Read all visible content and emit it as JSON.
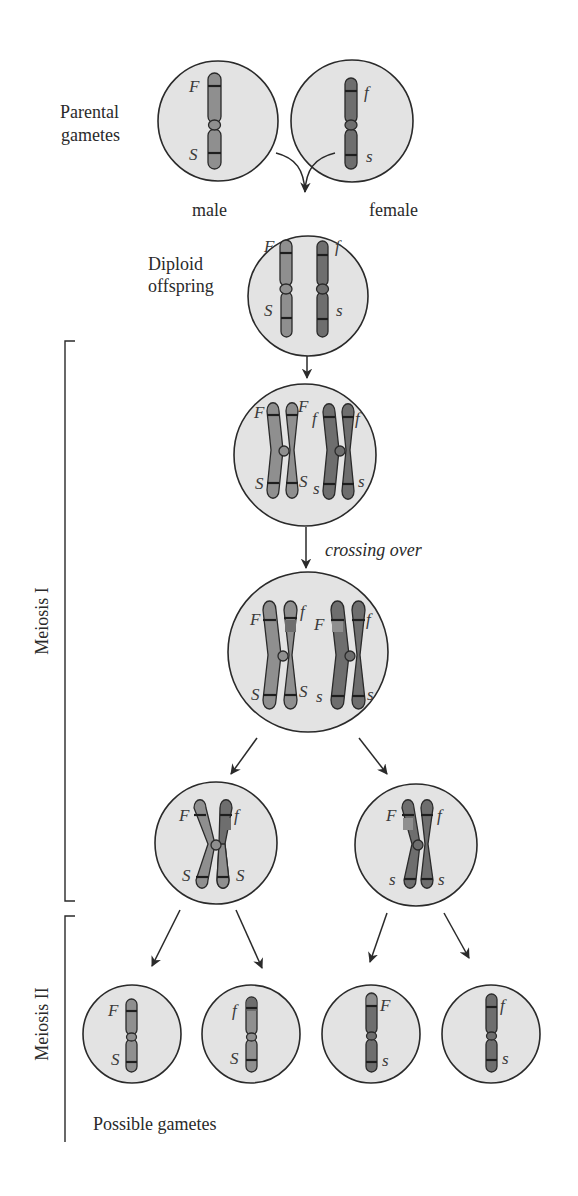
{
  "figure": {
    "stage_labels": {
      "parental_gametes_line1": "Parental",
      "parental_gametes_line2": "gametes",
      "male": "male",
      "female": "female",
      "diploid_line1": "Diploid",
      "diploid_line2": "offspring",
      "crossing_over": "crossing over",
      "possible_gametes": "Possible gametes"
    },
    "phases": {
      "meiosis_1": "Meiosis I",
      "meiosis_2": "Meiosis II"
    },
    "alleles": {
      "F": "F",
      "f": "f",
      "S": "S",
      "s": "s"
    },
    "cells": [
      {
        "id": "male-gamete",
        "alleles": [
          "F",
          "S"
        ]
      },
      {
        "id": "female-gamete",
        "alleles": [
          "f",
          "s"
        ]
      },
      {
        "id": "diploid-offspring",
        "alleles": [
          "F",
          "S",
          "f",
          "s"
        ]
      },
      {
        "id": "replicated-pairs",
        "alleles": [
          "F",
          "F",
          "S",
          "S",
          "f",
          "f",
          "s",
          "s"
        ]
      },
      {
        "id": "after-crossing-over",
        "alleles": [
          "F",
          "f",
          "S",
          "S",
          "F",
          "f",
          "s",
          "s"
        ]
      },
      {
        "id": "meiosis1-product-left",
        "alleles": [
          "F",
          "f",
          "S",
          "S"
        ]
      },
      {
        "id": "meiosis1-product-right",
        "alleles": [
          "F",
          "f",
          "s",
          "s"
        ]
      },
      {
        "id": "gamete-1",
        "alleles": [
          "F",
          "S"
        ]
      },
      {
        "id": "gamete-2",
        "alleles": [
          "f",
          "S"
        ]
      },
      {
        "id": "gamete-3",
        "alleles": [
          "F",
          "s"
        ]
      },
      {
        "id": "gamete-4",
        "alleles": [
          "f",
          "s"
        ]
      }
    ],
    "colors": {
      "cell_fill": "#e3e3e3",
      "paternal_chromosome": "#8f8f8f",
      "maternal_chromosome": "#6e6e6e",
      "outline": "#2a2a2a"
    }
  }
}
